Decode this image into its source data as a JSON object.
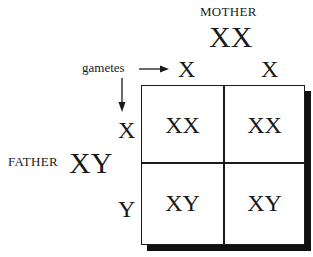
{
  "mother": {
    "label": "MOTHER",
    "genotype": "XX",
    "gametes": [
      "X",
      "X"
    ]
  },
  "father": {
    "label": "FATHER",
    "genotype": "XY",
    "gametes": [
      "X",
      "Y"
    ]
  },
  "gametes_label": "gametes",
  "grid": {
    "cells": [
      [
        "XX",
        "XX"
      ],
      [
        "XY",
        "XY"
      ]
    ]
  }
}
